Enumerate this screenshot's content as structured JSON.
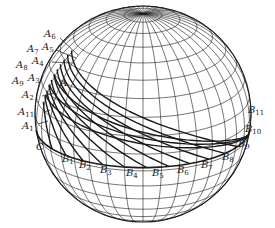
{
  "figure": {
    "type": "sphere-wireframe",
    "colors": {
      "line": "#1a1a1a",
      "background": "#ffffff"
    }
  },
  "labels": {
    "A6": {
      "base": "A",
      "sub": "6"
    },
    "A7": {
      "base": "A",
      "sub": "7"
    },
    "A5": {
      "base": "A",
      "sub": "5"
    },
    "A8": {
      "base": "A",
      "sub": "8"
    },
    "A4": {
      "base": "A",
      "sub": "4"
    },
    "A9": {
      "base": "A",
      "sub": "9"
    },
    "A3": {
      "base": "A",
      "sub": "3"
    },
    "A": {
      "base": "A",
      "sub": ""
    },
    "A2": {
      "base": "A",
      "sub": "2"
    },
    "A11": {
      "base": "A",
      "sub": "11"
    },
    "A1": {
      "base": "A",
      "sub": "1"
    },
    "C": {
      "base": "C",
      "sub": ""
    },
    "B1": {
      "base": "B",
      "sub": "1"
    },
    "B2": {
      "base": "B",
      "sub": "2"
    },
    "B3": {
      "base": "B",
      "sub": "3"
    },
    "B4": {
      "base": "B",
      "sub": "4"
    },
    "B5": {
      "base": "B",
      "sub": "5"
    },
    "B6": {
      "base": "B",
      "sub": "6"
    },
    "B7": {
      "base": "B",
      "sub": "7"
    },
    "B8": {
      "base": "B",
      "sub": "8"
    },
    "B9": {
      "base": "B",
      "sub": "9"
    },
    "B10": {
      "base": "B",
      "sub": "10"
    },
    "B11": {
      "base": "B",
      "sub": "11"
    }
  }
}
